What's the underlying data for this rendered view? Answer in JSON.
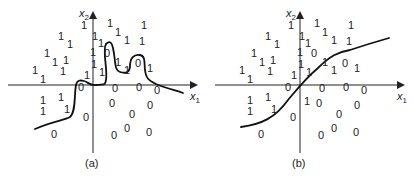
{
  "panels": [
    {
      "id": "a",
      "caption": "(a)",
      "x_axis_label": "x",
      "x_axis_sub": "1",
      "y_axis_label": "x",
      "y_axis_sub": "2",
      "boundary": "overfit",
      "class1_points": [
        [
          84,
          25
        ],
        [
          110,
          23
        ],
        [
          144,
          25
        ],
        [
          61,
          36
        ],
        [
          118,
          32
        ],
        [
          70,
          44
        ],
        [
          95,
          36
        ],
        [
          127,
          40
        ],
        [
          142,
          41
        ],
        [
          47,
          53
        ],
        [
          101,
          43
        ],
        [
          93,
          52
        ],
        [
          55,
          62
        ],
        [
          66,
          60
        ],
        [
          118,
          62
        ],
        [
          35,
          70
        ],
        [
          63,
          71
        ],
        [
          94,
          64
        ],
        [
          43,
          79
        ],
        [
          87,
          75
        ],
        [
          102,
          72
        ],
        [
          127,
          70
        ],
        [
          150,
          68
        ],
        [
          43,
          100
        ],
        [
          61,
          97
        ],
        [
          43,
          111
        ],
        [
          67,
          109
        ]
      ],
      "class0_points": [
        [
          107,
          53
        ],
        [
          138,
          63
        ],
        [
          81,
          87
        ],
        [
          115,
          88
        ],
        [
          139,
          87
        ],
        [
          157,
          90
        ],
        [
          112,
          103
        ],
        [
          150,
          105
        ],
        [
          86,
          117
        ],
        [
          132,
          114
        ],
        [
          127,
          128
        ],
        [
          54,
          134
        ],
        [
          114,
          135
        ],
        [
          149,
          132
        ]
      ]
    },
    {
      "id": "b",
      "caption": "(b)",
      "x_axis_label": "x",
      "x_axis_sub": "1",
      "y_axis_label": "x",
      "y_axis_sub": "2",
      "boundary": "smooth",
      "class1_points": [
        [
          291,
          25
        ],
        [
          317,
          23
        ],
        [
          351,
          25
        ],
        [
          268,
          36
        ],
        [
          325,
          32
        ],
        [
          277,
          44
        ],
        [
          302,
          36
        ],
        [
          334,
          40
        ],
        [
          349,
          41
        ],
        [
          254,
          53
        ],
        [
          308,
          43
        ],
        [
          300,
          52
        ],
        [
          262,
          62
        ],
        [
          273,
          60
        ],
        [
          325,
          62
        ],
        [
          242,
          70
        ],
        [
          270,
          71
        ],
        [
          301,
          64
        ],
        [
          250,
          79
        ],
        [
          294,
          75
        ],
        [
          309,
          72
        ],
        [
          334,
          70
        ],
        [
          357,
          68
        ],
        [
          250,
          100
        ],
        [
          268,
          97
        ],
        [
          250,
          111
        ],
        [
          274,
          109
        ],
        [
          307,
          101
        ]
      ],
      "class0_points": [
        [
          314,
          53
        ],
        [
          345,
          63
        ],
        [
          288,
          87
        ],
        [
          322,
          88
        ],
        [
          346,
          87
        ],
        [
          364,
          90
        ],
        [
          319,
          103
        ],
        [
          357,
          105
        ],
        [
          293,
          117
        ],
        [
          339,
          114
        ],
        [
          334,
          128
        ],
        [
          261,
          134
        ],
        [
          321,
          135
        ],
        [
          356,
          132
        ]
      ]
    }
  ],
  "labels": {
    "one": "1",
    "zero": "0"
  }
}
